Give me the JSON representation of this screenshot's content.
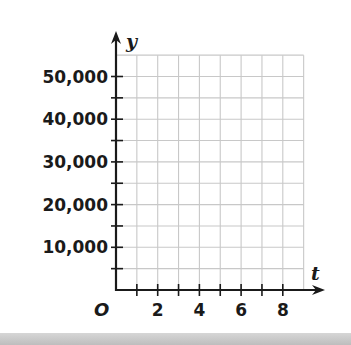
{
  "chart_data": {
    "type": "line",
    "title": "",
    "xlabel": "t",
    "ylabel": "y",
    "origin_label": "O",
    "xlim": [
      0,
      9
    ],
    "ylim": [
      0,
      55000
    ],
    "x_ticks": [
      1,
      2,
      3,
      4,
      5,
      6,
      7,
      8
    ],
    "x_tick_labels": [
      "2",
      "4",
      "6",
      "8"
    ],
    "x_tick_label_values": [
      2,
      4,
      6,
      8
    ],
    "y_ticks": [
      5000,
      10000,
      15000,
      20000,
      25000,
      30000,
      35000,
      40000,
      45000,
      50000
    ],
    "y_tick_labels": [
      "10,000",
      "20,000",
      "30,000",
      "40,000",
      "50,000"
    ],
    "y_tick_label_values": [
      10000,
      20000,
      30000,
      40000,
      50000
    ],
    "grid": true,
    "grid_x_step": 1,
    "grid_y_step": 5000,
    "series": [],
    "legend": null
  },
  "colors": {
    "axis": "#1a1a1a",
    "grid": "#c8c8c8",
    "background": "#ffffff",
    "bottom_band": "#c4c4c4"
  }
}
